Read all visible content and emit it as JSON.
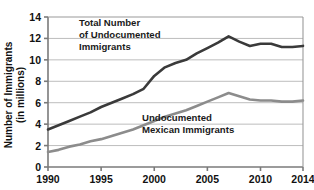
{
  "chart_data": {
    "type": "line",
    "title": "",
    "xlabel": "",
    "ylabel": "Number of Immigrants (in millions)",
    "ylabel_line1": "Number of Immigrants",
    "ylabel_line2": "(in millions)",
    "xlim": [
      1990,
      2014
    ],
    "ylim": [
      0,
      14
    ],
    "ytick_labels": [
      "0",
      "2",
      "4",
      "6",
      "8",
      "10",
      "12",
      "14"
    ],
    "yticks": [
      0,
      2,
      4,
      6,
      8,
      10,
      12,
      14
    ],
    "xtick_labels": [
      "1990",
      "1995",
      "2000",
      "2005",
      "2010",
      "2014"
    ],
    "xticks": [
      1990,
      1995,
      2000,
      2005,
      2010,
      2014
    ],
    "grid": "horizontal",
    "legend_position": "inline-annotations",
    "x": [
      1990,
      1991,
      1992,
      1993,
      1994,
      1995,
      1996,
      1997,
      1998,
      1999,
      2000,
      2001,
      2002,
      2003,
      2004,
      2005,
      2006,
      2007,
      2008,
      2009,
      2010,
      2011,
      2012,
      2013,
      2014
    ],
    "series": [
      {
        "name": "Total Number of Undocumented Immigrants",
        "label_line1": "Total Number",
        "label_line2": "of Undocumented",
        "label_line3": "Immigrants",
        "color": "#3a3a3a",
        "values": [
          3.5,
          3.9,
          4.3,
          4.7,
          5.1,
          5.6,
          6.0,
          6.4,
          6.8,
          7.3,
          8.5,
          9.3,
          9.7,
          10.0,
          10.6,
          11.1,
          11.6,
          12.2,
          11.7,
          11.3,
          11.5,
          11.5,
          11.2,
          11.2,
          11.3
        ]
      },
      {
        "name": "Undocumented Mexican Immigrants",
        "label_line1": "Undocumented",
        "label_line2": "Mexican Immigrants",
        "color": "#8c8c8c",
        "values": [
          1.4,
          1.6,
          1.9,
          2.1,
          2.4,
          2.6,
          2.9,
          3.2,
          3.5,
          3.9,
          4.3,
          4.7,
          5.0,
          5.3,
          5.7,
          6.1,
          6.5,
          6.9,
          6.6,
          6.3,
          6.2,
          6.2,
          6.1,
          6.1,
          6.2
        ]
      }
    ],
    "annotations": [
      {
        "name": "total-undocumented-label",
        "lines": [
          "Total Number",
          "of Undocumented",
          "Immigrants"
        ],
        "x_px": 79,
        "y_px": 26
      },
      {
        "name": "mexican-undocumented-label",
        "lines": [
          "Undocumented",
          "Mexican Immigrants"
        ],
        "x_px": 142,
        "y_px": 121
      }
    ]
  },
  "colors": {
    "background": "#ffffff",
    "axis": "#7a7a7a",
    "grid": "#bdbdbd",
    "series_total": "#3a3a3a",
    "series_mexican": "#8c8c8c",
    "text": "#111111"
  }
}
